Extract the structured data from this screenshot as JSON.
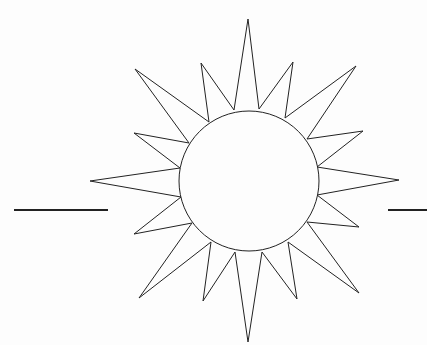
{
  "image": {
    "subject": "sun line drawing",
    "background": "#fdfdfd",
    "stroke": "#222222"
  },
  "sun": {
    "center": [
      249,
      181
    ],
    "radius": 70,
    "rays": [
      {
        "name": "top",
        "tip": [
          248,
          19
        ],
        "base": [
          [
            234,
            110
          ],
          [
            259,
            109
          ]
        ]
      },
      {
        "name": "upper-left-inner",
        "tip": [
          201,
          63
        ],
        "base": [
          [
            209,
            122
          ],
          [
            234,
            110
          ]
        ]
      },
      {
        "name": "upper-right-inner",
        "tip": [
          293,
          62
        ],
        "base": [
          [
            259,
            109
          ],
          [
            285,
            118
          ]
        ]
      },
      {
        "name": "upper-left-outer",
        "tip": [
          135,
          69
        ],
        "base": [
          [
            189,
            143
          ],
          [
            209,
            122
          ]
        ]
      },
      {
        "name": "upper-right-outer",
        "tip": [
          356,
          66
        ],
        "base": [
          [
            285,
            118
          ],
          [
            307,
            139
          ]
        ]
      },
      {
        "name": "left-upper",
        "tip": [
          134,
          133
        ],
        "base": [
          [
            180,
            168
          ],
          [
            189,
            143
          ]
        ]
      },
      {
        "name": "right-upper",
        "tip": [
          363,
          131
        ],
        "base": [
          [
            307,
            139
          ],
          [
            317,
            167
          ]
        ]
      },
      {
        "name": "left",
        "tip": [
          90,
          181
        ],
        "base": [
          [
            181,
            197
          ],
          [
            180,
            168
          ]
        ]
      },
      {
        "name": "right",
        "tip": [
          399,
          180
        ],
        "base": [
          [
            317,
            167
          ],
          [
            317,
            195
          ]
        ]
      },
      {
        "name": "left-lower",
        "tip": [
          134,
          234
        ],
        "base": [
          [
            192,
            223
          ],
          [
            181,
            197
          ]
        ]
      },
      {
        "name": "right-lower",
        "tip": [
          359,
          227
        ],
        "base": [
          [
            317,
            195
          ],
          [
            307,
            222
          ]
        ]
      },
      {
        "name": "lower-left-outer",
        "tip": [
          139,
          298
        ],
        "base": [
          [
            211,
            242
          ],
          [
            192,
            223
          ]
        ]
      },
      {
        "name": "lower-right-outer",
        "tip": [
          359,
          293
        ],
        "base": [
          [
            307,
            222
          ],
          [
            288,
            242
          ]
        ]
      },
      {
        "name": "lower-left-inner",
        "tip": [
          203,
          301
        ],
        "base": [
          [
            235,
            252
          ],
          [
            211,
            242
          ]
        ]
      },
      {
        "name": "lower-right-inner",
        "tip": [
          297,
          299
        ],
        "base": [
          [
            288,
            242
          ],
          [
            262,
            252
          ]
        ]
      },
      {
        "name": "bottom",
        "tip": [
          248,
          342
        ],
        "base": [
          [
            262,
            252
          ],
          [
            235,
            252
          ]
        ]
      }
    ]
  },
  "horizon_lines": [
    {
      "name": "left",
      "x1": 14,
      "x2": 108,
      "y": 210
    },
    {
      "name": "right",
      "x1": 388,
      "x2": 427,
      "y": 210
    }
  ]
}
